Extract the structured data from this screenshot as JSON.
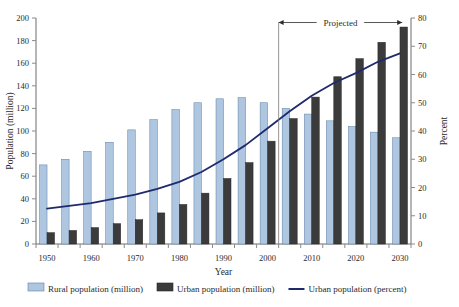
{
  "chart_data": {
    "type": "bar",
    "title": "",
    "xlabel": "Year",
    "ylabel": "Population (million)",
    "y2label": "Percent",
    "ylim": [
      0,
      200
    ],
    "y2lim": [
      0,
      80
    ],
    "ytick_step": 20,
    "y2tick_step": 10,
    "grid": false,
    "legend_position": "bottom",
    "categories": [
      1950,
      1955,
      1960,
      1965,
      1970,
      1975,
      1980,
      1985,
      1990,
      1995,
      2000,
      2005,
      2010,
      2015,
      2020,
      2025,
      2030
    ],
    "xtick_labels": [
      "1950",
      "1960",
      "1970",
      "1980",
      "1990",
      "2000",
      "2010",
      "2020",
      "2030"
    ],
    "xtick_values": [
      1950,
      1960,
      1970,
      1980,
      1990,
      2000,
      2010,
      2020,
      2030
    ],
    "series": [
      {
        "name": "Rural population (million)",
        "type": "bar",
        "axis": "left",
        "color": "#aec6e0",
        "edge_color": "#5d7fa3",
        "values": [
          70,
          75,
          82,
          90,
          101,
          110,
          119,
          125,
          128.5,
          129.5,
          125,
          120,
          115,
          109,
          104,
          99,
          94
        ]
      },
      {
        "name": "Urban population (million)",
        "type": "bar",
        "axis": "left",
        "color": "#3b3b3b",
        "edge_color": "#262626",
        "values": [
          10,
          12,
          14.5,
          18,
          21.5,
          27.5,
          35,
          45,
          58,
          72,
          91,
          111,
          130,
          148,
          164,
          178.5,
          192
        ]
      },
      {
        "name": "Urban population (percent)",
        "type": "line",
        "axis": "right",
        "color": "#1f2a6e",
        "values": [
          12.5,
          13.5,
          14.5,
          16,
          17.5,
          19.5,
          22,
          25.5,
          30,
          35,
          41,
          47,
          52.5,
          57,
          60.5,
          64.5,
          67.5
        ]
      }
    ],
    "annotations": [
      {
        "name": "projected-band",
        "label": "Projected",
        "start": 2002.5,
        "end": 2030.5,
        "y_value": 196
      }
    ]
  },
  "legend": {
    "items": [
      {
        "label": "Rural population (million)",
        "marker": "swatch-light-blue"
      },
      {
        "label": "Urban population (million)",
        "marker": "swatch-dark-gray"
      },
      {
        "label": "Urban population (percent)",
        "marker": "line-navy"
      }
    ]
  }
}
